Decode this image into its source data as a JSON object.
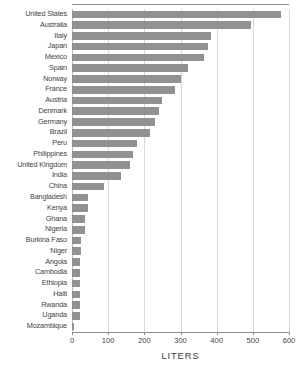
{
  "chart_data": {
    "type": "bar",
    "orientation": "horizontal",
    "title": "",
    "xlabel": "LITERS",
    "ylabel": "",
    "xlim": [
      0,
      600
    ],
    "xticks": [
      0,
      100,
      200,
      300,
      400,
      500,
      600
    ],
    "xtick_labels": [
      "0",
      "100",
      "200",
      "300",
      "400",
      "500",
      "600"
    ],
    "grid": true,
    "legend": false,
    "bar_color": "#919191",
    "categories": [
      "United States",
      "Australia",
      "Italy",
      "Japan",
      "Mexico",
      "Spain",
      "Norway",
      "France",
      "Austria",
      "Denmark",
      "Germany",
      "Brazil",
      "Peru",
      "Philippines",
      "United Kingdom",
      "India",
      "China",
      "Bangladesh",
      "Kenya",
      "Ghana",
      "Nigeria",
      "Burkina Faso",
      "Niger",
      "Angola",
      "Cambodia",
      "Ethiopia",
      "Haiti",
      "Rwanda",
      "Uganda",
      "Mozambique"
    ],
    "values": [
      578,
      495,
      385,
      375,
      365,
      320,
      300,
      285,
      250,
      240,
      230,
      215,
      180,
      170,
      160,
      135,
      88,
      44,
      44,
      36,
      36,
      26,
      26,
      22,
      22,
      22,
      22,
      22,
      22,
      5
    ]
  },
  "axis": {
    "title": "LITERS"
  }
}
